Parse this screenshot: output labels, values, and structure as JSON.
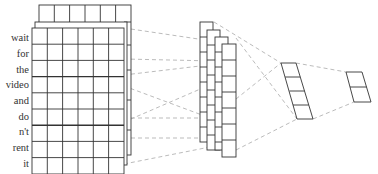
{
  "diagram": {
    "type": "cnn-text-classification",
    "input_words": [
      "wait",
      "for",
      "the",
      "video",
      "and",
      "do",
      "n't",
      "rent",
      "it"
    ],
    "embedding_columns": 6,
    "embedding_channels": 3,
    "feature_map_count": 4,
    "pooled_cells": 4,
    "output_cells": 2,
    "colors": {
      "grid_stroke": "#333333",
      "dashed_connector": "#aaaaaa",
      "text": "#333333",
      "background": "#ffffff"
    }
  }
}
